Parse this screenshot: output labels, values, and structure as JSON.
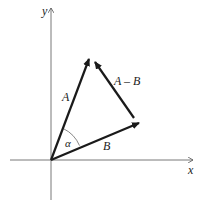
{
  "diagram": {
    "title": "",
    "axes": {
      "x_label": "x",
      "y_label": "y",
      "color": "#555555"
    },
    "vectors": [
      {
        "name": "A",
        "label": "A",
        "from": [
          51,
          160
        ],
        "to": [
          90,
          57
        ]
      },
      {
        "name": "B",
        "label": "B",
        "from": [
          51,
          160
        ],
        "to": [
          141,
          122
        ]
      },
      {
        "name": "A-B",
        "label": "A – B",
        "from": [
          134,
          118
        ],
        "to": [
          94,
          61
        ]
      }
    ],
    "angle": {
      "label": "α",
      "between": [
        "A",
        "B"
      ]
    },
    "vector_color": "#1a1a1a"
  }
}
